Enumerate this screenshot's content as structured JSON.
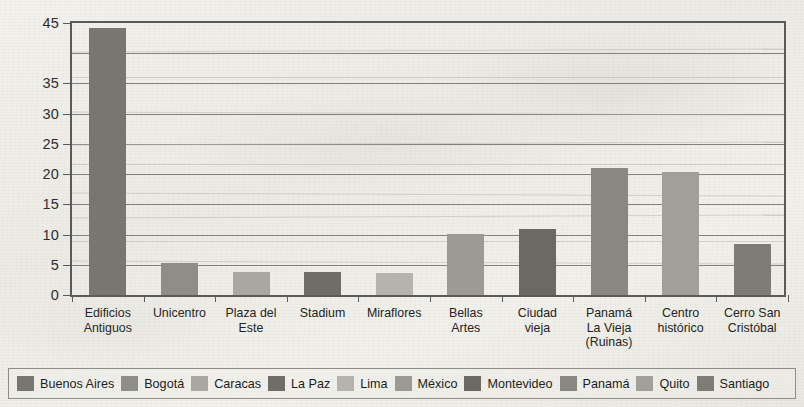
{
  "chart_data": {
    "type": "bar",
    "title": "",
    "xlabel": "",
    "ylabel": "",
    "ylim": [
      0,
      45
    ],
    "grid": true,
    "legend_position": "bottom",
    "ytick_labels": [
      "45",
      "35",
      "30",
      "25",
      "20",
      "15",
      "10",
      "5",
      "0"
    ],
    "ytick_values": [
      45,
      35,
      30,
      25,
      20,
      15,
      10,
      5,
      0
    ],
    "gridline_values": [
      45,
      40,
      35,
      30,
      25,
      20,
      15,
      10,
      5,
      0
    ],
    "categories": [
      "Edificios\nAntiguos",
      "Unicentro",
      "Plaza del\nEste",
      "Stadium",
      "Miraflores",
      "Bellas\nArtes",
      "Ciudad\nvieja",
      "Panamá\nLa Vieja\n(Ruinas)",
      "Centro\nhistórico",
      "Cerro San\nCristóbal"
    ],
    "values": [
      43.5,
      5.2,
      3.8,
      3.8,
      3.6,
      10.0,
      10.8,
      20.7,
      20.0,
      8.3
    ],
    "bar_colors": [
      "#78776f",
      "#8f8e86",
      "#a8a7a0",
      "#6f6e66",
      "#b4b3ac",
      "#9b9a93",
      "#6b6a62",
      "#888780",
      "#a09f98",
      "#7e7d75"
    ],
    "bar_cities": [
      "Buenos Aires",
      "Bogotá",
      "Caracas",
      "La Paz",
      "Lima",
      "México",
      "Montevideo",
      "Panamá",
      "Quito",
      "Santiago"
    ]
  },
  "legend": {
    "items": [
      {
        "label": "Buenos Aires",
        "color": "#78776f"
      },
      {
        "label": "Bogotá",
        "color": "#8f8e86"
      },
      {
        "label": "Caracas",
        "color": "#a8a7a0"
      },
      {
        "label": "La Paz",
        "color": "#6f6e66"
      },
      {
        "label": "Lima",
        "color": "#b4b3ac"
      },
      {
        "label": "México",
        "color": "#9b9a93"
      },
      {
        "label": "Montevideo",
        "color": "#6b6a62"
      },
      {
        "label": "Panamá",
        "color": "#888780"
      },
      {
        "label": "Quito",
        "color": "#a09f98"
      },
      {
        "label": "Santiago",
        "color": "#7e7d75"
      }
    ]
  },
  "colors": {
    "paper": "#efeee9",
    "axis": "#5a5a5a",
    "gridline": "#6d6d6d",
    "text": "#242424"
  }
}
